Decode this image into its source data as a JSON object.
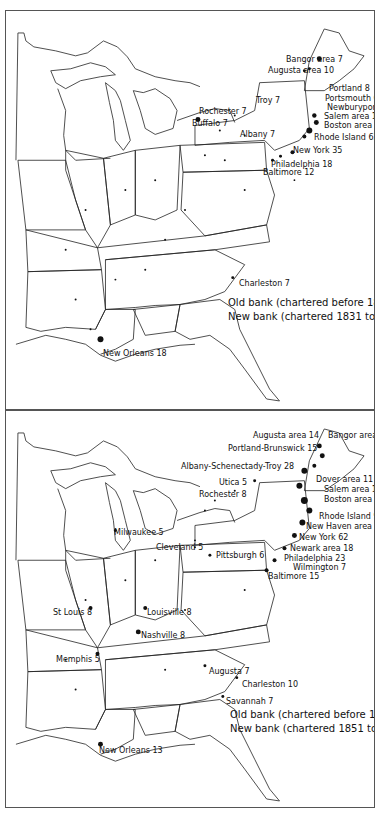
{
  "maps": [
    {
      "id": "map-1831-1840",
      "legend": {
        "old_label": "Old bank (chartered before 1831)",
        "new_label": "New bank (chartered 1831 to 1840)",
        "old_symbol": "open-circle",
        "new_symbol": "filled-dot"
      },
      "city_labels": [
        {
          "name": "Bangor area",
          "count": "7",
          "text": "Bangor area 7",
          "x": 280,
          "y": 44
        },
        {
          "name": "Augusta area",
          "count": "10",
          "text": "Augusta area 10",
          "x": 262,
          "y": 55
        },
        {
          "name": "Portland",
          "count": "8",
          "text": "Portland 8",
          "x": 323,
          "y": 73
        },
        {
          "name": "Portsmouth",
          "count": "6",
          "text": "Portsmouth 6",
          "x": 319,
          "y": 83
        },
        {
          "name": "Newburyport",
          "count": "5",
          "text": "Newburyport 5",
          "x": 321,
          "y": 92
        },
        {
          "name": "Salem area",
          "count": "12",
          "text": "Salem area 12",
          "x": 318,
          "y": 101
        },
        {
          "name": "Boston area",
          "count": "39",
          "text": "Boston area 39",
          "x": 318,
          "y": 110
        },
        {
          "name": "Troy",
          "count": "7",
          "text": "Troy 7",
          "x": 250,
          "y": 85
        },
        {
          "name": "Rochester",
          "count": "7",
          "text": "Rochester 7",
          "x": 193,
          "y": 96
        },
        {
          "name": "Buffalo",
          "count": "7",
          "text": "Buffalo 7",
          "x": 186,
          "y": 108
        },
        {
          "name": "Rhode Island",
          "count": "62",
          "text": "Rhode Island 62",
          "x": 308,
          "y": 115
        },
        {
          "name": "Albany",
          "count": "7",
          "text": "Albany 7",
          "x": 234,
          "y": 119
        },
        {
          "name": "New York",
          "count": "35",
          "text": "New York 35",
          "x": 287,
          "y": 133
        },
        {
          "name": "Philadelphia",
          "count": "18",
          "text": "Philadelphia 18",
          "x": 265,
          "y": 147
        },
        {
          "name": "Baltimore",
          "count": "12",
          "text": "Baltimore 12",
          "x": 257,
          "y": 154
        },
        {
          "name": "Charleston",
          "count": "7",
          "text": "Charleston 7",
          "x": 233,
          "y": 268
        },
        {
          "name": "New Orleans",
          "count": "18",
          "text": "New Orleans 18",
          "x": 97,
          "y": 338
        }
      ]
    },
    {
      "id": "map-1851-1861",
      "legend": {
        "old_label": "Old bank (chartered before 1851)",
        "new_label": "New bank (chartered 1851 to 1861)",
        "old_symbol": "open-circle",
        "new_symbol": "filled-dot"
      },
      "city_labels": [
        {
          "name": "Augusta area",
          "count": "14",
          "text": "Augusta area 14",
          "x": 247,
          "y": 20
        },
        {
          "name": "Bangor area",
          "count": "14",
          "text": "Bangor area 14",
          "x": 322,
          "y": 20
        },
        {
          "name": "Portland-Brunswick",
          "count": "15",
          "text": "Portland-Brunswick 15",
          "x": 222,
          "y": 33
        },
        {
          "name": "Albany-Schenectady-Troy",
          "count": "28",
          "text": "Albany-Schenectady-Troy 28",
          "x": 175,
          "y": 51
        },
        {
          "name": "Utica",
          "count": "5",
          "text": "Utica 5",
          "x": 213,
          "y": 67
        },
        {
          "name": "Rochester",
          "count": "8",
          "text": "Rochester 8",
          "x": 193,
          "y": 79
        },
        {
          "name": "Dover area",
          "count": "11",
          "text": "Dover area 11",
          "x": 310,
          "y": 64
        },
        {
          "name": "Salem area",
          "count": "18",
          "text": "Salem area 18",
          "x": 320,
          "y": 74
        },
        {
          "name": "Boston area",
          "count": "72",
          "text": "Boston area 72",
          "x": 318,
          "y": 84
        },
        {
          "name": "Rhode Island",
          "count": "93",
          "text": "Rhode Island 93",
          "x": 313,
          "y": 101
        },
        {
          "name": "New Haven area",
          "count": "15",
          "text": "New Haven area 15",
          "x": 303,
          "y": 112
        },
        {
          "name": "New York",
          "count": "62",
          "text": "New York 62",
          "x": 295,
          "y": 123
        },
        {
          "name": "Newark area",
          "count": "18",
          "text": "Newark area 18",
          "x": 285,
          "y": 134
        },
        {
          "name": "Philadelphia",
          "count": "23",
          "text": "Philadelphia 23",
          "x": 278,
          "y": 144
        },
        {
          "name": "Wilmington",
          "count": "7",
          "text": "Wilmington 7",
          "x": 287,
          "y": 153
        },
        {
          "name": "Baltimore",
          "count": "15",
          "text": "Baltimore 15",
          "x": 262,
          "y": 162
        },
        {
          "name": "Milwaukee",
          "count": "5",
          "text": "Milwaukee 5",
          "x": 108,
          "y": 117
        },
        {
          "name": "Cleveland",
          "count": "5",
          "text": "Cleveland 5",
          "x": 150,
          "y": 132
        },
        {
          "name": "Pittsburgh",
          "count": "6",
          "text": "Pittsburgh 6",
          "x": 210,
          "y": 140
        },
        {
          "name": "St Louis",
          "count": "8",
          "text": "St Louis 8",
          "x": 47,
          "y": 197
        },
        {
          "name": "Louisville",
          "count": "8",
          "text": "Louisville 8",
          "x": 141,
          "y": 197
        },
        {
          "name": "Nashville",
          "count": "8",
          "text": "Nashville 8",
          "x": 135,
          "y": 220
        },
        {
          "name": "Memphis",
          "count": "5",
          "text": "Memphis 5",
          "x": 50,
          "y": 244
        },
        {
          "name": "Augusta",
          "count": "7",
          "text": "Augusta 7",
          "x": 203,
          "y": 256
        },
        {
          "name": "Charleston",
          "count": "10",
          "text": "Charleston 10",
          "x": 236,
          "y": 269
        },
        {
          "name": "Savannah",
          "count": "7",
          "text": "Savannah 7",
          "x": 220,
          "y": 286
        },
        {
          "name": "New Orleans",
          "count": "13",
          "text": "New Orleans 13",
          "x": 93,
          "y": 335
        }
      ]
    }
  ]
}
